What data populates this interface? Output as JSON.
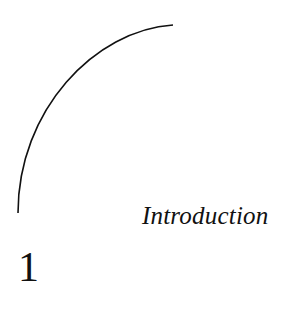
{
  "chapter": {
    "number": "1",
    "title": "Introduction"
  },
  "colors": {
    "ink": "#111111",
    "background": "#ffffff"
  }
}
